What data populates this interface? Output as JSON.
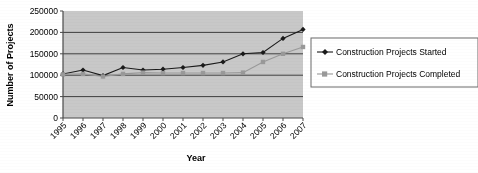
{
  "chart_data": {
    "type": "line",
    "title": "",
    "xlabel": "Year",
    "ylabel": "Number of Projects",
    "categories": [
      "1995",
      "1996",
      "1997",
      "1998",
      "1999",
      "2000",
      "2001",
      "2002",
      "2003",
      "2004",
      "2005",
      "2006",
      "2007"
    ],
    "ylim": [
      0,
      250000
    ],
    "ytick_labels": [
      "0",
      "50000",
      "100000",
      "150000",
      "200000",
      "250000"
    ],
    "ytick_values": [
      0,
      50000,
      100000,
      150000,
      200000,
      250000
    ],
    "grid": "horizontal",
    "legend_position": "right",
    "plot_background": "#c8c8c8",
    "series": [
      {
        "name": "Construction Projects Started",
        "color": "#1a1a1a",
        "marker": "diamond",
        "values": [
          103000,
          112000,
          99000,
          118000,
          112000,
          114000,
          118000,
          123000,
          131000,
          150000,
          153000,
          186000,
          207000
        ]
      },
      {
        "name": "Construction Projects Completed",
        "color": "#999999",
        "marker": "square",
        "values": [
          102000,
          103000,
          97000,
          103000,
          106000,
          105000,
          105000,
          105000,
          105000,
          106000,
          131000,
          150000,
          166000
        ]
      }
    ]
  },
  "legend": {
    "entries": [
      {
        "label": "Construction Projects Started",
        "marker": "diamond-marker",
        "color": "#1a1a1a"
      },
      {
        "label": "Construction Projects Completed",
        "marker": "square-marker",
        "color": "#999999"
      }
    ]
  }
}
